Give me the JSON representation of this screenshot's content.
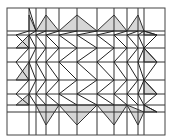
{
  "diagram": {
    "width": 178,
    "height": 140,
    "colors": {
      "line": "#333333",
      "shade": "#d6d6d6",
      "background": "#ffffff"
    },
    "frame": {
      "x": 7,
      "y": 8,
      "w": 158,
      "h": 127
    },
    "vertical_lines_x": [
      29,
      36,
      46,
      59,
      77,
      97,
      114,
      127,
      138,
      144
    ],
    "horizontal_lines_y": [
      31,
      35,
      48,
      62,
      80,
      94,
      105,
      112
    ],
    "shaded_triangles": [
      [
        [
          29,
          15
        ],
        [
          29,
          31
        ],
        [
          36,
          31
        ]
      ],
      [
        [
          36,
          31
        ],
        [
          46,
          15
        ],
        [
          59,
          31
        ]
      ],
      [
        [
          59,
          31
        ],
        [
          77,
          15
        ],
        [
          97,
          31
        ]
      ],
      [
        [
          97,
          31
        ],
        [
          114,
          15
        ],
        [
          127,
          31
        ]
      ],
      [
        [
          127,
          31
        ],
        [
          138,
          15
        ],
        [
          144,
          31
        ]
      ],
      [
        [
          29,
          35
        ],
        [
          16,
          48
        ],
        [
          29,
          48
        ]
      ],
      [
        [
          29,
          62
        ],
        [
          16,
          80
        ],
        [
          29,
          80
        ]
      ],
      [
        [
          29,
          94
        ],
        [
          16,
          105
        ],
        [
          29,
          105
        ]
      ],
      [
        [
          144,
          31
        ],
        [
          157,
          35
        ],
        [
          144,
          35
        ]
      ],
      [
        [
          144,
          48
        ],
        [
          157,
          62
        ],
        [
          144,
          62
        ]
      ],
      [
        [
          144,
          80
        ],
        [
          157,
          94
        ],
        [
          144,
          94
        ]
      ],
      [
        [
          144,
          105
        ],
        [
          157,
          112
        ],
        [
          144,
          112
        ]
      ],
      [
        [
          36,
          105
        ],
        [
          46,
          125
        ],
        [
          59,
          105
        ]
      ],
      [
        [
          59,
          105
        ],
        [
          77,
          125
        ],
        [
          97,
          105
        ]
      ],
      [
        [
          97,
          105
        ],
        [
          114,
          125
        ],
        [
          127,
          105
        ]
      ],
      [
        [
          127,
          105
        ],
        [
          138,
          125
        ],
        [
          144,
          112
        ]
      ]
    ],
    "zigzags": [
      [
        [
          29,
          31
        ],
        [
          16,
          35
        ],
        [
          29,
          48
        ],
        [
          16,
          62
        ],
        [
          29,
          80
        ],
        [
          16,
          94
        ],
        [
          29,
          105
        ]
      ],
      [
        [
          36,
          31
        ],
        [
          29,
          35
        ],
        [
          36,
          48
        ],
        [
          29,
          62
        ],
        [
          36,
          80
        ],
        [
          29,
          94
        ],
        [
          36,
          105
        ]
      ],
      [
        [
          46,
          31
        ],
        [
          36,
          35
        ],
        [
          46,
          48
        ],
        [
          36,
          62
        ],
        [
          46,
          80
        ],
        [
          36,
          94
        ],
        [
          46,
          105
        ]
      ],
      [
        [
          59,
          31
        ],
        [
          46,
          35
        ],
        [
          59,
          48
        ],
        [
          46,
          62
        ],
        [
          59,
          80
        ],
        [
          46,
          94
        ],
        [
          59,
          105
        ]
      ],
      [
        [
          77,
          31
        ],
        [
          59,
          35
        ],
        [
          77,
          48
        ],
        [
          59,
          62
        ],
        [
          77,
          80
        ],
        [
          59,
          94
        ],
        [
          77,
          105
        ]
      ],
      [
        [
          97,
          31
        ],
        [
          77,
          35
        ],
        [
          97,
          48
        ],
        [
          77,
          62
        ],
        [
          97,
          80
        ],
        [
          77,
          94
        ],
        [
          97,
          105
        ]
      ],
      [
        [
          114,
          31
        ],
        [
          97,
          35
        ],
        [
          114,
          48
        ],
        [
          97,
          62
        ],
        [
          114,
          80
        ],
        [
          97,
          94
        ],
        [
          114,
          105
        ]
      ],
      [
        [
          127,
          31
        ],
        [
          114,
          35
        ],
        [
          127,
          48
        ],
        [
          114,
          62
        ],
        [
          127,
          80
        ],
        [
          114,
          94
        ],
        [
          127,
          105
        ]
      ],
      [
        [
          138,
          31
        ],
        [
          127,
          35
        ],
        [
          138,
          48
        ],
        [
          127,
          62
        ],
        [
          138,
          80
        ],
        [
          127,
          94
        ],
        [
          138,
          105
        ]
      ],
      [
        [
          144,
          31
        ],
        [
          138,
          35
        ],
        [
          144,
          48
        ],
        [
          138,
          62
        ],
        [
          144,
          80
        ],
        [
          138,
          94
        ],
        [
          144,
          105
        ]
      ],
      [
        [
          29,
          8
        ],
        [
          36,
          31
        ]
      ],
      [
        [
          144,
          31
        ],
        [
          157,
          35
        ],
        [
          144,
          48
        ],
        [
          157,
          62
        ],
        [
          144,
          80
        ],
        [
          157,
          94
        ],
        [
          144,
          105
        ],
        [
          157,
          112
        ]
      ]
    ]
  }
}
